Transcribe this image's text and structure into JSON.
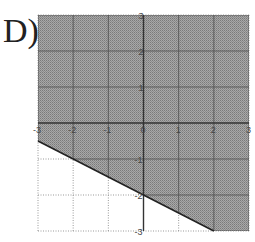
{
  "question_label": "D)",
  "chart_data": {
    "type": "line",
    "title": "",
    "xlabel": "",
    "ylabel": "",
    "xlim": [
      -3,
      3
    ],
    "ylim": [
      -3,
      3
    ],
    "grid": true,
    "x_ticks": [
      "-3",
      "-2",
      "-1",
      "0",
      "1",
      "2",
      "3"
    ],
    "y_ticks": [
      "3",
      "2",
      "1",
      "-1",
      "-2",
      "-3"
    ],
    "boundary_line": {
      "equation": "y = -1/2 x - 2",
      "slope": -0.5,
      "intercept": -2,
      "style": "solid",
      "points": [
        [
          -3,
          -0.5
        ],
        [
          -2,
          -1
        ],
        [
          0,
          -2
        ],
        [
          2,
          -3
        ]
      ]
    },
    "shaded_region": "above",
    "inequality": "y >= -1/2 x - 2",
    "colors": {
      "shade": "#9a9a9a",
      "line": "#222222",
      "grid": "#555555",
      "dotted_grid": "#999999"
    }
  }
}
